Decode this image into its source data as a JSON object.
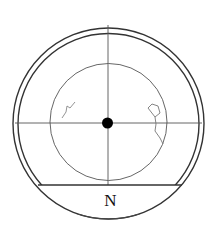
{
  "diagram": {
    "type": "circular-sky-chart",
    "direction_label": "N",
    "colors": {
      "stroke": "#333333",
      "thin_stroke": "#555555",
      "center_dot": "#000000",
      "background": "#ffffff"
    },
    "elements": [
      "outer-ring",
      "inner-ring",
      "field-circle",
      "crosshair-horizontal",
      "crosshair-vertical",
      "center-dot",
      "horizon-chord",
      "constellation-left",
      "constellation-right"
    ]
  }
}
